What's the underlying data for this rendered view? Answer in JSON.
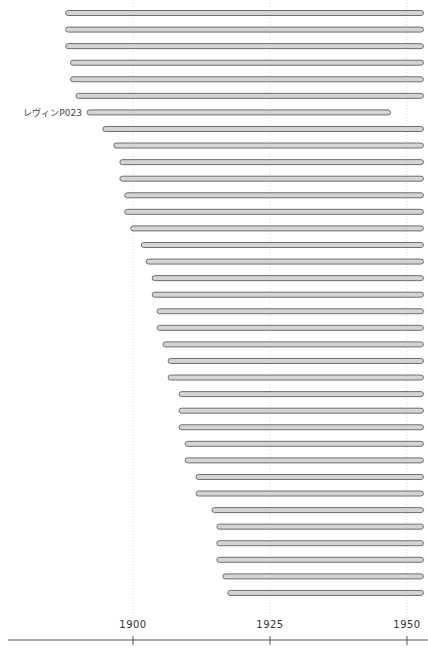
{
  "chart_data": {
    "type": "bar",
    "orientation": "horizontal-range",
    "title": "",
    "xlabel": "",
    "ylabel": "",
    "xlim": [
      1876,
      1953
    ],
    "x_ticks": [
      1900,
      1925,
      1950
    ],
    "x_tick_labels": [
      "1900",
      "1925",
      "1950"
    ],
    "grid": true,
    "bar_color": "#d4d4d4",
    "bar_edge_color": "#6e6e6e",
    "series": [
      {
        "label": "",
        "start": 1887.7,
        "end": 1953
      },
      {
        "label": "",
        "start": 1887.7,
        "end": 1953
      },
      {
        "label": "",
        "start": 1887.7,
        "end": 1953
      },
      {
        "label": "",
        "start": 1888.6,
        "end": 1953
      },
      {
        "label": "",
        "start": 1888.6,
        "end": 1953
      },
      {
        "label": "",
        "start": 1889.6,
        "end": 1953
      },
      {
        "label": "レヴィンP023",
        "start": 1891.6,
        "end": 1947
      },
      {
        "label": "",
        "start": 1894.5,
        "end": 1953
      },
      {
        "label": "",
        "start": 1896.5,
        "end": 1953
      },
      {
        "label": "",
        "start": 1897.6,
        "end": 1953
      },
      {
        "label": "",
        "start": 1897.6,
        "end": 1953
      },
      {
        "label": "",
        "start": 1898.5,
        "end": 1953
      },
      {
        "label": "",
        "start": 1898.5,
        "end": 1953
      },
      {
        "label": "",
        "start": 1899.6,
        "end": 1953
      },
      {
        "label": "",
        "start": 1901.5,
        "end": 1953
      },
      {
        "label": "",
        "start": 1902.4,
        "end": 1953
      },
      {
        "label": "",
        "start": 1903.5,
        "end": 1953
      },
      {
        "label": "",
        "start": 1903.5,
        "end": 1953
      },
      {
        "label": "",
        "start": 1904.4,
        "end": 1953
      },
      {
        "label": "",
        "start": 1904.4,
        "end": 1953
      },
      {
        "label": "",
        "start": 1905.5,
        "end": 1953
      },
      {
        "label": "",
        "start": 1906.4,
        "end": 1953
      },
      {
        "label": "",
        "start": 1906.4,
        "end": 1953
      },
      {
        "label": "",
        "start": 1908.4,
        "end": 1953
      },
      {
        "label": "",
        "start": 1908.4,
        "end": 1953
      },
      {
        "label": "",
        "start": 1908.4,
        "end": 1953
      },
      {
        "label": "",
        "start": 1909.5,
        "end": 1953
      },
      {
        "label": "",
        "start": 1909.5,
        "end": 1953
      },
      {
        "label": "",
        "start": 1911.5,
        "end": 1953
      },
      {
        "label": "",
        "start": 1911.5,
        "end": 1953
      },
      {
        "label": "",
        "start": 1914.4,
        "end": 1953
      },
      {
        "label": "",
        "start": 1915.3,
        "end": 1953
      },
      {
        "label": "",
        "start": 1915.3,
        "end": 1953
      },
      {
        "label": "",
        "start": 1915.3,
        "end": 1953
      },
      {
        "label": "",
        "start": 1916.4,
        "end": 1953
      },
      {
        "label": "",
        "start": 1917.3,
        "end": 1953
      }
    ]
  }
}
